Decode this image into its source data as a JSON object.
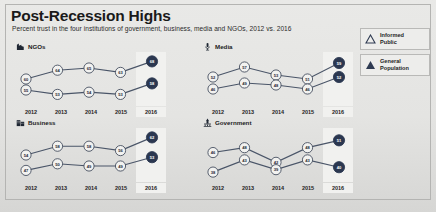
{
  "header": {
    "title": "Post-Recession Highs",
    "subtitle": "Percent trust in the four institutions of government, business, media and NGOs, 2012 vs. 2016"
  },
  "legend": {
    "items": [
      {
        "label_line1": "Informed",
        "label_line2": "Public",
        "marker": "triangle-outline",
        "color": "#2f3b52"
      },
      {
        "label_line1": "General",
        "label_line2": "Population",
        "marker": "triangle-filled",
        "color": "#2f3b52"
      }
    ]
  },
  "axis": {
    "years": [
      "2012",
      "2013",
      "2014",
      "2015",
      "2016"
    ],
    "highlight_year": "2016"
  },
  "colors": {
    "line": "#4a5568",
    "node_fill": "#f2f2f0",
    "node_stroke": "#3d4758",
    "node_text": "#1f2733",
    "highlight_fill": "#2b3750",
    "highlight_text": "#ffffff",
    "band": "#f1f1ef"
  },
  "chart_data": [
    {
      "type": "line",
      "title": "NGOs",
      "icon": "ngo-icon",
      "x": [
        "2012",
        "2013",
        "2014",
        "2015",
        "2016"
      ],
      "xlabel": "",
      "ylabel": "Percent trust",
      "ylim": [
        50,
        70
      ],
      "grid": false,
      "legend_position": "external-right",
      "series": [
        {
          "name": "Informed Public",
          "values": [
            60,
            64,
            65,
            63,
            68
          ]
        },
        {
          "name": "General Population",
          "values": [
            55,
            53,
            54,
            53,
            58
          ]
        }
      ]
    },
    {
      "type": "line",
      "title": "Media",
      "icon": "media-icon",
      "x": [
        "2012",
        "2013",
        "2014",
        "2015",
        "2016"
      ],
      "xlabel": "",
      "ylabel": "Percent trust",
      "ylim": [
        40,
        62
      ],
      "grid": false,
      "legend_position": "external-right",
      "series": [
        {
          "name": "Informed Public",
          "values": [
            52,
            57,
            53,
            51,
            59
          ]
        },
        {
          "name": "General Population",
          "values": [
            46,
            49,
            48,
            46,
            52
          ]
        }
      ]
    },
    {
      "type": "line",
      "title": "Business",
      "icon": "business-icon",
      "x": [
        "2012",
        "2013",
        "2014",
        "2015",
        "2016"
      ],
      "xlabel": "",
      "ylabel": "Percent trust",
      "ylim": [
        44,
        64
      ],
      "grid": false,
      "legend_position": "external-right",
      "series": [
        {
          "name": "Informed Public",
          "values": [
            54,
            58,
            58,
            56,
            62
          ]
        },
        {
          "name": "General Population",
          "values": [
            47,
            50,
            49,
            49,
            53
          ]
        }
      ]
    },
    {
      "type": "line",
      "title": "Government",
      "icon": "government-icon",
      "x": [
        "2012",
        "2013",
        "2014",
        "2015",
        "2016"
      ],
      "xlabel": "",
      "ylabel": "Percent trust",
      "ylim": [
        36,
        54
      ],
      "grid": false,
      "legend_position": "external-right",
      "series": [
        {
          "name": "Informed Public",
          "values": [
            46,
            48,
            42,
            48,
            51
          ]
        },
        {
          "name": "General Population",
          "values": [
            38,
            43,
            39,
            43,
            40
          ]
        }
      ]
    }
  ]
}
